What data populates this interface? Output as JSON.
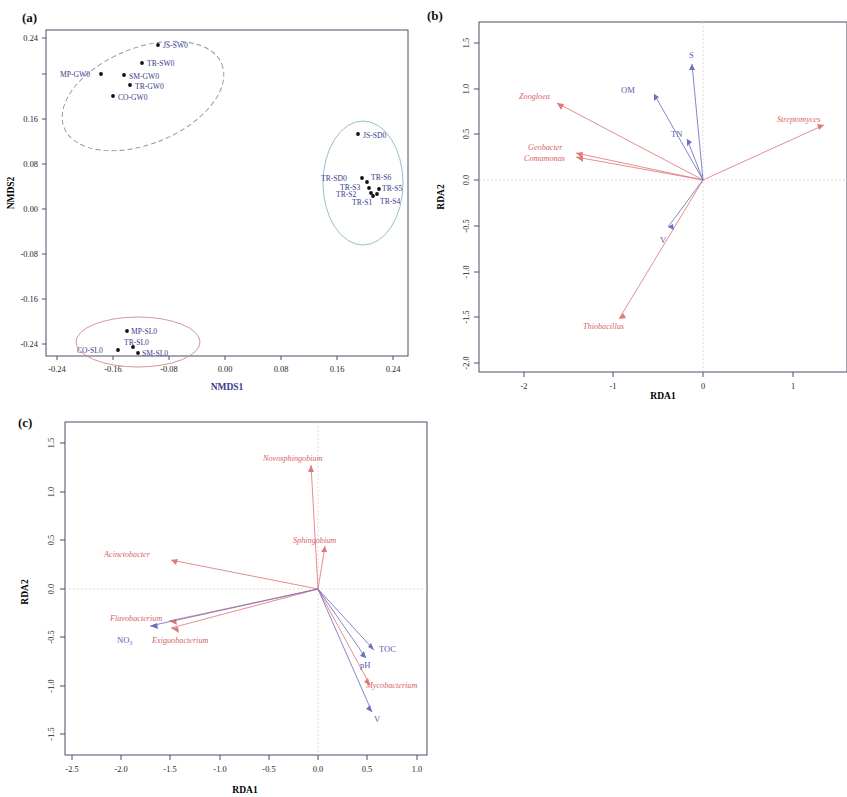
{
  "figure": {
    "panels": [
      "(a)",
      "(b)",
      "(c)"
    ]
  },
  "panel_a": {
    "label": "(a)",
    "xlabel": "NMDS1",
    "ylabel": "NMDS2",
    "xticks": [
      "-0.24",
      "-0.16",
      "-0.08",
      "0.00",
      "0.08",
      "0.16",
      "0.24"
    ],
    "yticks": [
      "-0.24",
      "-0.16",
      "-0.08",
      "0.00",
      "0.08",
      "0.16",
      "0.24"
    ],
    "points": [
      {
        "label": "JS-SW0",
        "x": -0.113,
        "y": 0.212
      },
      {
        "label": "TR-SW0",
        "x": -0.137,
        "y": 0.18
      },
      {
        "label": "MP-GW0",
        "x": -0.221,
        "y": 0.16
      },
      {
        "label": "SM-GW0",
        "x": -0.146,
        "y": 0.158
      },
      {
        "label": "TR-GW0",
        "x": -0.139,
        "y": 0.141
      },
      {
        "label": "CO-GW0",
        "x": -0.162,
        "y": 0.122
      },
      {
        "label": "JS-SD0",
        "x": 0.178,
        "y": 0.082
      },
      {
        "label": "TR-SD0",
        "x": 0.188,
        "y": 0.003
      },
      {
        "label": "TR-S6",
        "x": 0.196,
        "y": -0.002
      },
      {
        "label": "TR-S3",
        "x": 0.198,
        "y": -0.012
      },
      {
        "label": "TR-S5",
        "x": 0.213,
        "y": -0.013
      },
      {
        "label": "TR-S2",
        "x": 0.2,
        "y": -0.018
      },
      {
        "label": "TR-S1",
        "x": 0.201,
        "y": -0.022
      },
      {
        "label": "TR-S4",
        "x": 0.207,
        "y": -0.019
      },
      {
        "label": "MP-SL0",
        "x": -0.159,
        "y": -0.236
      },
      {
        "label": "TR-SL0",
        "x": -0.151,
        "y": -0.258
      },
      {
        "label": "CO-SL0",
        "x": -0.173,
        "y": -0.262
      },
      {
        "label": "SM-SL0",
        "x": -0.144,
        "y": -0.266
      }
    ],
    "ellipses": [
      {
        "group": "groundwater-surface",
        "style": "dashed-grey"
      },
      {
        "group": "sediment",
        "style": "solid-blue"
      },
      {
        "group": "soil",
        "style": "solid-red"
      }
    ]
  },
  "panel_b": {
    "label": "(b)",
    "xlabel": "RDA1",
    "ylabel": "RDA2",
    "xticks": [
      "-2",
      "-1",
      "0",
      "1"
    ],
    "yticks": [
      "-2.0",
      "-1.5",
      "-1.0",
      "-0.5",
      "0.0",
      "0.5",
      "1.0",
      "1.5"
    ],
    "xlim": [
      -2.55,
      1.55
    ],
    "ylim": [
      -2.1,
      1.72
    ],
    "species": [
      {
        "name": "Zoogloea",
        "x": -1.63,
        "y": 0.84
      },
      {
        "name": "Geobacter",
        "x": -1.42,
        "y": 0.3
      },
      {
        "name": "Comamonas",
        "x": -1.42,
        "y": 0.26
      },
      {
        "name": "Streptomyces",
        "x": 1.35,
        "y": 0.6
      },
      {
        "name": "Thiobacillus",
        "x": -0.93,
        "y": -1.52
      }
    ],
    "environment": [
      {
        "name": "S",
        "x": -0.12,
        "y": 1.26
      },
      {
        "name": "OM",
        "x": -0.55,
        "y": 0.94
      },
      {
        "name": "TN",
        "x": -0.18,
        "y": 0.45
      },
      {
        "name": "V",
        "x": -0.39,
        "y": -0.52
      }
    ]
  },
  "panel_c": {
    "label": "(c)",
    "xlabel": "RDA1",
    "ylabel": "RDA2",
    "xticks": [
      "-2.5",
      "-2.0",
      "-1.5",
      "-1.0",
      "-0.5",
      "0.0",
      "0.5",
      "1.0"
    ],
    "yticks": [
      "-1.5",
      "-1.0",
      "-0.5",
      "0.0",
      "0.5",
      "1.0",
      "1.5"
    ],
    "xlim": [
      -2.72,
      1.18
    ],
    "ylim": [
      -1.72,
      1.72
    ],
    "species": [
      {
        "name": "Novosphingobium",
        "x": -0.07,
        "y": 1.28
      },
      {
        "name": "Sphingobium",
        "x": 0.07,
        "y": 0.45
      },
      {
        "name": "Acinetobacter",
        "x": -1.5,
        "y": 0.3
      },
      {
        "name": "Flavobacterium",
        "x": -1.52,
        "y": -0.33
      },
      {
        "name": "Exiguobacterium",
        "x": -1.5,
        "y": -0.4
      },
      {
        "name": "Mycobacterium",
        "x": 0.53,
        "y": -0.98
      }
    ],
    "environment": [
      {
        "name": "NO₃",
        "x": -1.7,
        "y": -0.38
      },
      {
        "name": "TOC",
        "x": 0.57,
        "y": -0.62
      },
      {
        "name": "pH",
        "x": 0.49,
        "y": -0.7
      },
      {
        "name": "V",
        "x": 0.55,
        "y": -1.26
      }
    ]
  }
}
